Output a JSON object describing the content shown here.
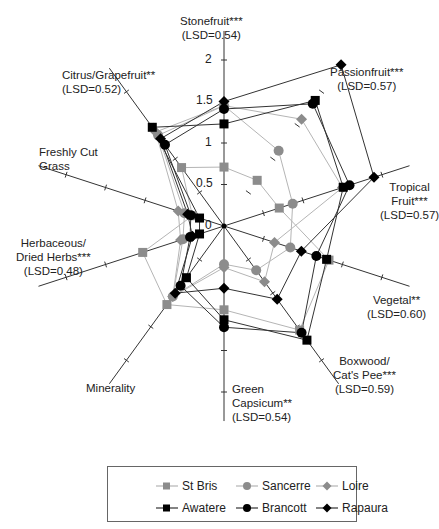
{
  "chart_data": {
    "type": "radar",
    "title": "",
    "center": [
      224,
      226
    ],
    "px_per_unit": 83,
    "rmax": 2.0,
    "ticks": [
      0,
      0.5,
      1,
      1.5,
      2
    ],
    "tick_labels": [
      "0",
      "0.5",
      "1",
      "1.5",
      "2"
    ],
    "axes": [
      {
        "name": "Stonefruit***",
        "lsd": "(LSD=0.54)",
        "angle": 90
      },
      {
        "name": "Passionfruit***",
        "lsd": "(LSD=0.57)",
        "angle": 54
      },
      {
        "name": "Tropical Fruit***",
        "lsd": "(LSD=0.57)",
        "angle": 18
      },
      {
        "name": "Vegetal**",
        "lsd": "(LSD=0.60)",
        "angle": -18
      },
      {
        "name": "Boxwood/ Cat's Pee***",
        "lsd": "(LSD=0.59)",
        "angle": -54
      },
      {
        "name": "Green Capsicum**",
        "lsd": "(LSD=0.54)",
        "angle": -90
      },
      {
        "name": "Minerality",
        "lsd": "",
        "angle": -126
      },
      {
        "name": "Herbaceous/ Dried Herbs***",
        "lsd": "(LSD=0.48)",
        "angle": -162
      },
      {
        "name": "Freshly Cut Grass",
        "lsd": "",
        "angle": 162
      },
      {
        "name": "Citrus/Grapefruit**",
        "lsd": "(LSD=0.52)",
        "angle": 126
      }
    ],
    "categories": [
      "Stonefruit",
      "Passionfruit",
      "Tropical Fruit",
      "Vegetal",
      "Boxwood/Cat's Pee",
      "Green Capsicum",
      "Minerality",
      "Herbaceous/Dried Herbs",
      "Freshly Cut Grass",
      "Citrus/Grapefruit"
    ],
    "series": [
      {
        "name": "St Bris",
        "marker": "square",
        "color": "#8c8c8c",
        "line": "#b5b5b5",
        "values": [
          0.71,
          0.68,
          0.7,
          1.33,
          1.55,
          1.01,
          1.17,
          1.03,
          0.4,
          0.87
        ]
      },
      {
        "name": "Sancerre",
        "marker": "circle",
        "color": "#8c8c8c",
        "line": "#b5b5b5",
        "values": [
          1.45,
          1.12,
          0.87,
          0.84,
          0.66,
          0.46,
          1.05,
          0.52,
          0.5,
          1.35
        ]
      },
      {
        "name": "Loire",
        "marker": "diamond",
        "color": "#8c8c8c",
        "line": "#b5b5b5",
        "values": [
          1.45,
          1.59,
          1.5,
          0.64,
          0.83,
          0.5,
          1.05,
          0.55,
          0.58,
          1.4
        ]
      },
      {
        "name": "Awatere",
        "marker": "square",
        "color": "#000000",
        "line": "#333333",
        "values": [
          1.23,
          1.87,
          1.51,
          1.3,
          1.7,
          1.13,
          0.77,
          0.31,
          0.31,
          1.47
        ]
      },
      {
        "name": "Brancott",
        "marker": "circle",
        "color": "#000000",
        "line": "#333333",
        "values": [
          1.41,
          1.82,
          1.59,
          1.17,
          1.59,
          1.22,
          0.89,
          0.43,
          0.42,
          1.21
        ]
      },
      {
        "name": "Rapaura",
        "marker": "diamond",
        "color": "#000000",
        "line": "#333333",
        "values": [
          1.5,
          2.4,
          1.9,
          0.98,
          1.09,
          0.75,
          1.0,
          0.4,
          0.46,
          1.3
        ]
      }
    ],
    "legend_position": "bottom"
  },
  "labels": {
    "stonefruit": "Stonefruit***\n(LSD=0.54)",
    "passionfruit": "Passionfruit***\n(LSD=0.57)",
    "tropical": "Tropical\nFruit***\n(LSD=0.57)",
    "vegetal": "Vegetal**\n(LSD=0.60)",
    "boxwood": "Boxwood/\nCat's Pee***\n(LSD=0.59)",
    "capsicum": "Green\nCapsicum**\n(LSD=0.54)",
    "minerality": "Minerality",
    "herbaceous": "Herbaceous/\nDried Herbs***\n(LSD=0.48)",
    "grass": "Freshly Cut\nGrass",
    "citrus": "Citrus/Grapefruit**\n(LSD=0.52)"
  },
  "legend": {
    "items": [
      "St Bris",
      "Sancerre",
      "Loire",
      "Awatere",
      "Brancott",
      "Rapaura"
    ]
  }
}
